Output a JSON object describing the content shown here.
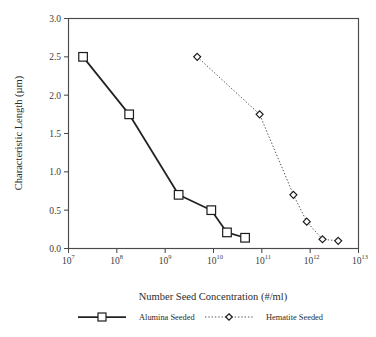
{
  "chart_data": {
    "type": "line",
    "title": "",
    "xlabel": "Number Seed Concentration (#/ml)",
    "ylabel": "Characteristic Length (µm)",
    "xscale": "log",
    "yscale": "linear",
    "xlim": [
      10000000.0,
      10000000000000.0
    ],
    "ylim": [
      0.0,
      3.0
    ],
    "grid": false,
    "legend_position": "below-axes",
    "xticks": [
      {
        "value": 10000000.0,
        "base": "10",
        "exponent": "7"
      },
      {
        "value": 100000000.0,
        "base": "10",
        "exponent": "8"
      },
      {
        "value": 1000000000.0,
        "base": "10",
        "exponent": "9"
      },
      {
        "value": 10000000000.0,
        "base": "10",
        "exponent": "10"
      },
      {
        "value": 100000000000.0,
        "base": "10",
        "exponent": "11"
      },
      {
        "value": 1000000000000.0,
        "base": "10",
        "exponent": "12"
      },
      {
        "value": 10000000000000.0,
        "base": "10",
        "exponent": "13"
      }
    ],
    "yticks": [
      {
        "value": 0.0,
        "label": "0.0"
      },
      {
        "value": 0.5,
        "label": "0.5"
      },
      {
        "value": 1.0,
        "label": "1.0"
      },
      {
        "value": 1.5,
        "label": "1.5"
      },
      {
        "value": 2.0,
        "label": "2.0"
      },
      {
        "value": 2.5,
        "label": "2.5"
      },
      {
        "value": 3.0,
        "label": "3.0"
      }
    ],
    "series": [
      {
        "name": "Alumina Seeded",
        "marker": "open-square",
        "linestyle": "solid",
        "color": "#222222",
        "points": [
          {
            "x": 20000000.0,
            "y": 2.5
          },
          {
            "x": 180000000.0,
            "y": 1.75
          },
          {
            "x": 1900000000.0,
            "y": 0.7
          },
          {
            "x": 9000000000.0,
            "y": 0.5
          },
          {
            "x": 19000000000.0,
            "y": 0.21
          },
          {
            "x": 45000000000.0,
            "y": 0.14
          }
        ]
      },
      {
        "name": "Hematite Seeded",
        "marker": "open-diamond",
        "linestyle": "dotted",
        "color": "#555555",
        "points": [
          {
            "x": 4600000000.0,
            "y": 2.5
          },
          {
            "x": 90000000000.0,
            "y": 1.75
          },
          {
            "x": 450000000000.0,
            "y": 0.7
          },
          {
            "x": 850000000000.0,
            "y": 0.35
          },
          {
            "x": 1800000000000.0,
            "y": 0.12
          },
          {
            "x": 3800000000000.0,
            "y": 0.1
          }
        ]
      }
    ]
  },
  "legend": {
    "entries": [
      {
        "label": "Alumina Seeded",
        "marker": "open-square",
        "linestyle": "solid"
      },
      {
        "label": "Hematite Seeded",
        "marker": "open-diamond",
        "linestyle": "dotted"
      }
    ]
  }
}
